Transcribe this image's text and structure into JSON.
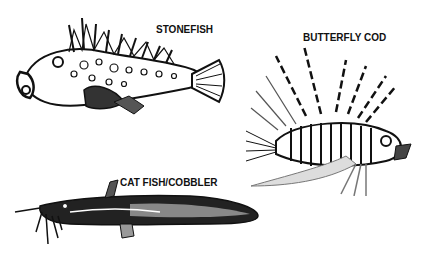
{
  "labels": {
    "stonefish": "STONEFISH",
    "butterfly_cod": "BUTTERFLY COD",
    "catfish": "CAT FISH/COBBLER"
  },
  "colors": {
    "ink": "#111111",
    "background": "#ffffff",
    "mid_gray": "#777777"
  }
}
